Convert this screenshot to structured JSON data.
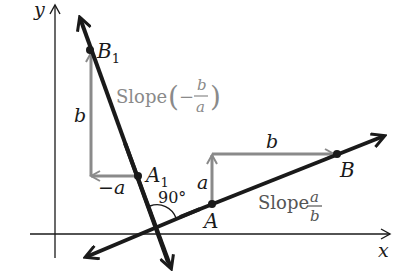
{
  "diagram": {
    "axes": {
      "x_label": "x",
      "y_label": "y"
    },
    "colors": {
      "main": "#1a1a1a",
      "gray": "#8a8a8a",
      "background": "#ffffff"
    },
    "line_ab": {
      "points": {
        "A": "A",
        "B": "B"
      },
      "slope_text": "Slope",
      "slope_num": "a",
      "slope_den": "b",
      "rise_label": "a",
      "run_label": "b"
    },
    "line_a1b1": {
      "points": {
        "A1_base": "A",
        "A1_sub": "1",
        "B1_base": "B",
        "B1_sub": "1"
      },
      "slope_text": "Slope",
      "slope_open": "(",
      "slope_sign": "−",
      "slope_num": "b",
      "slope_den": "a",
      "slope_close": ")",
      "rise_label": "b",
      "run_label": "−a"
    },
    "angle_label": "90°"
  }
}
